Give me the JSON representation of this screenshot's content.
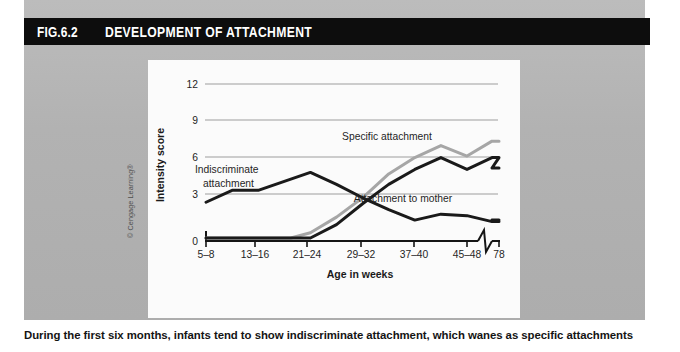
{
  "figure": {
    "number": "FIG.6.2",
    "title": "DEVELOPMENT OF ATTACHMENT",
    "credit": "© Cengage Learning®",
    "caption": "During the first six months, infants tend to show indiscriminate attachment, which wanes as specific attachments"
  },
  "colors": {
    "title_bar_bg": "#0d0d0d",
    "title_bar_text": "#ffffff",
    "panel_bg": "#b4b4b4",
    "plot_bg": "#fbfbfb",
    "gridline": "#9a9a9a",
    "axis": "#151515",
    "series_dark": "#1a1a1a",
    "series_gray": "#a6a6a6"
  },
  "chart_data": {
    "type": "line",
    "title": "DEVELOPMENT OF ATTACHMENT",
    "xlabel": "Age in weeks",
    "ylabel": "Intensity score",
    "grid": true,
    "legend_position": "inline-annotations",
    "ylim": [
      0,
      13
    ],
    "yticks": [
      0,
      3,
      6,
      9,
      12
    ],
    "categories": [
      "5–8",
      "13–16",
      "21–24",
      "29–32",
      "37–40",
      "45–48",
      "78"
    ],
    "xtick_labels": [
      "5–8",
      "13–16",
      "21–24",
      "29–32",
      "37–40",
      "45–48",
      "78"
    ],
    "axis_break": true,
    "axis_break_note": "zig-zag break in x-axis between 45–48 and 78 weeks",
    "series": [
      {
        "name": "Indiscriminate attachment",
        "color": "#1a1a1a",
        "label_text": "Indiscriminate\nattachment",
        "x": [
          6.5,
          10.5,
          14.5,
          18.5,
          22.5,
          26.5,
          30.5,
          34.5,
          38.5,
          42.5,
          46.5,
          52,
          78
        ],
        "values": [
          2.4,
          3.2,
          3.2,
          3.8,
          4.4,
          3.6,
          2.7,
          1.9,
          1.2,
          1.6,
          1.5,
          1.1,
          1.2
        ]
      },
      {
        "name": "Specific attachment",
        "color": "#a6a6a6",
        "label_text": "Specific attachment",
        "x": [
          6.5,
          14.5,
          19.5,
          22.5,
          26.5,
          30.5,
          34.5,
          38.5,
          42.5,
          46.5,
          52,
          78
        ],
        "values": [
          0,
          0,
          0,
          0.35,
          1.4,
          2.7,
          4.3,
          5.4,
          6.2,
          5.5,
          6.5,
          6.5
        ]
      },
      {
        "name": "Attachment to mother",
        "color": "#1a1a1a",
        "label_text": "Attachment to mother",
        "x": [
          6.5,
          14.5,
          22.5,
          26.5,
          30.5,
          34.5,
          38.5,
          42.5,
          46.5,
          52,
          78
        ],
        "values": [
          0,
          0,
          0,
          0.9,
          2.3,
          3.6,
          4.6,
          5.4,
          4.6,
          5.4,
          4.7
        ]
      }
    ],
    "annotations": [
      {
        "text": "Indiscriminate attachment",
        "x": 11,
        "y": 5.0
      },
      {
        "text": "Specific attachment",
        "x": 40,
        "y": 7.6
      },
      {
        "text": "Attachment to mother",
        "x": 42,
        "y": 4.0
      }
    ]
  }
}
